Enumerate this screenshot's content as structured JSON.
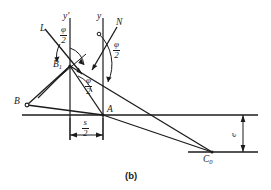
{
  "figure": {
    "caption": "(b)",
    "background_color": "#ffffff",
    "line_color": "#1b1b1b",
    "labels": {
      "ray_L": "L",
      "axis_y_prime": "y'",
      "axis_y": "y",
      "ray_N": "N",
      "point_B1": "B",
      "point_B1_sub": "1",
      "point_B": "B",
      "point_A": "A",
      "point_C0": "C",
      "point_C0_sub": "0",
      "dim_offset_num": "s",
      "dim_offset_den": "2",
      "dim_vertical": "e",
      "angle_phi_num": "φ",
      "angle_phi_den": "2"
    },
    "angle_labels": [
      {
        "id": "phi-over-2-upper-left",
        "num": "φ",
        "den": "2"
      },
      {
        "id": "phi-over-2-upper-right",
        "num": "φ",
        "den": "2"
      },
      {
        "id": "phi-over-2-middle",
        "num": "φ",
        "den": "2"
      }
    ],
    "geometry": {
      "point_B1": [
        70,
        66
      ],
      "point_B": [
        26,
        105
      ],
      "point_A": [
        103,
        115
      ],
      "point_C0": [
        212,
        152
      ],
      "axis_y_prime_x": 70,
      "axis_y_x": 103,
      "horizontal_axis_y": 115,
      "baseline_y": 152,
      "dim_line_y": 135
    }
  }
}
